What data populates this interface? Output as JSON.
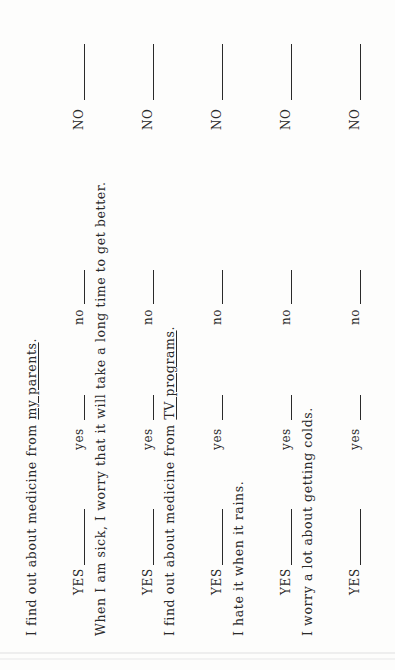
{
  "document": {
    "orientation": "rotated-90-ccw",
    "items": [
      {
        "statement_prefix": "I find out about medicine from ",
        "statement_underlined": "my parents",
        "statement_suffix": ".",
        "options": {
          "YES": "YES",
          "yes": "yes",
          "no": "no",
          "NO": "NO"
        }
      },
      {
        "statement_prefix": "When I am sick, I worry that it will take a long time to get better.",
        "statement_underlined": "",
        "statement_suffix": "",
        "options": {
          "YES": "YES",
          "yes": "yes",
          "no": "no",
          "NO": "NO"
        }
      },
      {
        "statement_prefix": "I find out about medicine from ",
        "statement_underlined": "TV programs",
        "statement_suffix": ".",
        "options": {
          "YES": "YES",
          "yes": "yes",
          "no": "no",
          "NO": "NO"
        }
      },
      {
        "statement_prefix": "I hate it when it rains.",
        "statement_underlined": "",
        "statement_suffix": "",
        "options": {
          "YES": "YES",
          "yes": "yes",
          "no": "no",
          "NO": "NO"
        }
      },
      {
        "statement_prefix": "I worry a lot about getting colds.",
        "statement_underlined": "",
        "statement_suffix": "",
        "options": {
          "YES": "YES",
          "yes": "yes",
          "no": "no",
          "NO": "NO"
        }
      }
    ]
  }
}
